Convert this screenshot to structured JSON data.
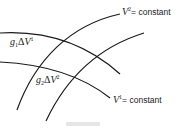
{
  "diagram": {
    "labels": {
      "v2_constant": {
        "var": "V",
        "sup": "2",
        "text": "= constant"
      },
      "v1_constant": {
        "var": "V",
        "sup": "1",
        "text": "= constant"
      },
      "g1_dv1": {
        "g": "g",
        "gsub": "1",
        "delta": "Δ",
        "var": "V",
        "sup": "1"
      },
      "g2_dv2": {
        "g": "g",
        "gsub": "2",
        "delta": "Δ",
        "var": "V",
        "sup": "2"
      }
    },
    "curves": {
      "v1_upper": "M0,33 C35,31 80,38 120,74",
      "v1_lower": "M0,62 C40,64 80,74 110,98",
      "v2_left": "M17,110 C35,60 70,25 120,14",
      "v2_right": "M46,121 C70,70 105,45 144,33"
    },
    "stroke_color": "#1a1a1a"
  }
}
